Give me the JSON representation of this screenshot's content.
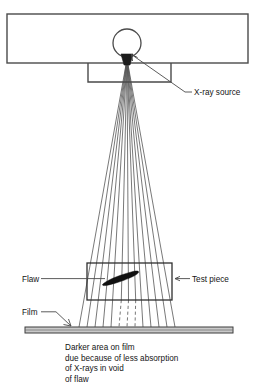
{
  "diagram": {
    "labels": {
      "source": "X-ray source",
      "flaw": "Flaw",
      "test_piece": "Test piece",
      "film": "Film"
    },
    "caption": {
      "line1": "Darker area on film",
      "line2": "due because of less absorption",
      "line3": "of X-rays in void",
      "line4": "of flaw"
    },
    "colors": {
      "stroke": "#4a4a4a",
      "ray": "#555555",
      "flaw_fill": "#111111",
      "film_fill": "#c9c9c9",
      "emitter_fill": "#1c1c1c",
      "background": "#ffffff",
      "text": "#141414"
    },
    "geometry": {
      "housing": {
        "x": 7,
        "y": 14,
        "width": 241,
        "height": 49
      },
      "collimator": {
        "x": 88,
        "y": 63,
        "width": 83,
        "height": 19
      },
      "tube_circle": {
        "cx": 127,
        "cy": 43,
        "r": 14
      },
      "emitter": {
        "cx": 127,
        "cy": 60,
        "width": 12,
        "height": 11
      },
      "test_piece": {
        "x": 87,
        "y": 263,
        "width": 85,
        "height": 37
      },
      "film": {
        "x": 25,
        "y": 327,
        "width": 208,
        "height": 6
      },
      "ray_count": 13,
      "ray_origin": {
        "x": 127,
        "y": 59
      },
      "ray_spread_at_film": 96,
      "dashed_ray_indices": [
        5,
        6,
        7
      ]
    }
  }
}
